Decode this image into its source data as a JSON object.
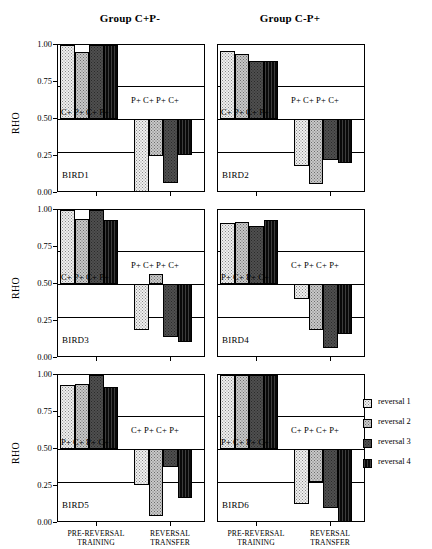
{
  "figure": {
    "y_axis_label": "RHO",
    "y_ticks": [
      "1.00",
      "0.75",
      "0.50",
      "0.25",
      "0.00"
    ],
    "y_tick_values": [
      1.0,
      0.75,
      0.5,
      0.25,
      0.0
    ],
    "phase_labels": [
      {
        "line1": "PRE-REVERSAL",
        "line2": "TRAINING"
      },
      {
        "line1": "REVERSAL",
        "line2": "TRANSFER"
      }
    ],
    "reference_line": 0.72,
    "reference_line_lower": 0.28,
    "baseline": 0.5
  },
  "groups": [
    {
      "title": "Group C+P-"
    },
    {
      "title": "Group C-P+"
    }
  ],
  "legend": {
    "items": [
      {
        "label": "reversal 1",
        "pattern": "pat1",
        "color": "#efefef"
      },
      {
        "label": "reversal 2",
        "pattern": "pat2",
        "color": "#c8c8c8"
      },
      {
        "label": "reversal 3",
        "pattern": "pat3",
        "color": "#4f4f4f"
      },
      {
        "label": "reversal 4",
        "pattern": "pat4",
        "color": "#141414"
      }
    ]
  },
  "chart_data": {
    "type": "bar",
    "ylabel": "RHO",
    "xlabel": "",
    "ylim": [
      0.0,
      1.0
    ],
    "baseline": 0.5,
    "grid": false,
    "reference_lines": [
      0.72,
      0.28
    ],
    "legend_position": "right",
    "categories": [
      "PRE-REVERSAL TRAINING",
      "REVERSAL TRANSFER"
    ],
    "series_names": [
      "reversal 1",
      "reversal 2",
      "reversal 3",
      "reversal 4"
    ],
    "panels": [
      {
        "name": "BIRD1",
        "group": "Group C+P-",
        "annotation_training": "C+ P+ C+ P+",
        "annotation_transfer": "P+ C+ P+ C+",
        "training": [
          1.0,
          0.95,
          1.0,
          1.0
        ],
        "transfer": [
          0.0,
          0.25,
          0.07,
          0.26
        ]
      },
      {
        "name": "BIRD2",
        "group": "Group C+P-",
        "annotation_training": "C+ P+ C+ P+",
        "annotation_transfer": "P+ C+ P+ C+",
        "training": [
          0.96,
          0.94,
          0.89,
          0.89
        ],
        "transfer": [
          0.18,
          0.06,
          0.22,
          0.2
        ]
      },
      {
        "name": "BIRD3",
        "group": "Group C+P-",
        "annotation_training": "C+ P+ C+ P+",
        "annotation_transfer": "P+ C+ P+ C+",
        "training": [
          1.0,
          0.94,
          1.0,
          0.93
        ],
        "transfer": [
          0.19,
          0.57,
          0.14,
          0.11
        ]
      },
      {
        "name": "BIRD4",
        "group": "Group C-P+",
        "annotation_training": "P+ C+ P+ C+",
        "annotation_transfer": "C+ P+ C+ P+",
        "training": [
          0.91,
          0.92,
          0.89,
          0.93
        ],
        "transfer": [
          0.4,
          0.19,
          0.07,
          0.16
        ]
      },
      {
        "name": "BIRD5",
        "group": "Group C-P+",
        "annotation_training": "P+ C+ P+ C+",
        "annotation_transfer": "C+ P+ C+ P+",
        "training": [
          0.93,
          0.94,
          1.0,
          0.92
        ],
        "transfer": [
          0.26,
          0.05,
          0.38,
          0.17
        ]
      },
      {
        "name": "BIRD6",
        "group": "Group C-P+",
        "annotation_training": "P+ C+ P+ C+",
        "annotation_transfer": "C+ P+ C+ P+",
        "training": [
          1.0,
          1.0,
          1.0,
          1.0
        ],
        "transfer": [
          0.13,
          0.28,
          0.1,
          0.0
        ]
      }
    ]
  }
}
